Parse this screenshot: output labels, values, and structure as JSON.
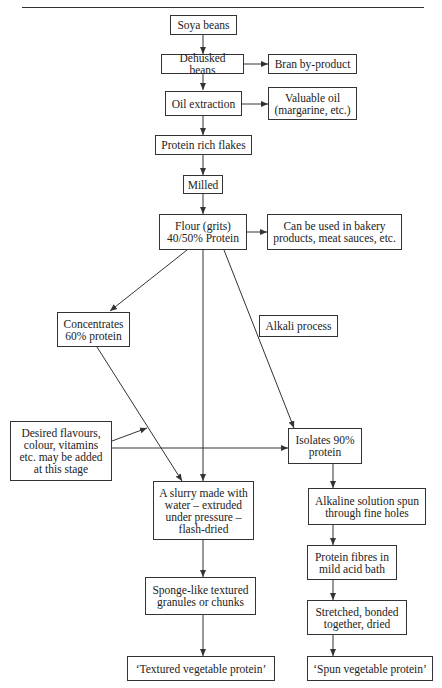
{
  "nodes": {
    "soya": "Soya beans",
    "dehusked": "Dehusked beans",
    "bran": "Bran by-product",
    "oil": "Oil extraction",
    "valuable_oil": "Valuable oil\n(margarine, etc.)",
    "flakes": "Protein rich flakes",
    "milled": "Milled",
    "flour": "Flour (grits)\n40/50% Protein",
    "bakery": "Can be used in bakery\nproducts, meat sauces, etc.",
    "concentrates": "Concentrates\n60% protein",
    "alkali": "Alkali process",
    "flavours": "Desired flavours,\ncolour, vitamins\netc. may be added\nat this stage",
    "isolates": "Isolates 90%\nprotein",
    "slurry": "A slurry made with\nwater – extruded\nunder pressure –\nflash-dried",
    "alkaline": "Alkaline solution spun\nthrough fine holes",
    "fibres": "Protein fibres in\nmild acid bath",
    "sponge": "Sponge-like textured\ngranules or chunks",
    "stretched": "Stretched, bonded\ntogether, dried",
    "tvp": "‘Textured vegetable protein’",
    "svp": "‘Spun vegetable protein’"
  },
  "edges": [
    {
      "from": "soya",
      "to": "dehusked"
    },
    {
      "from": "dehusked",
      "to": "bran"
    },
    {
      "from": "dehusked",
      "to": "oil"
    },
    {
      "from": "oil",
      "to": "valuable_oil"
    },
    {
      "from": "oil",
      "to": "flakes"
    },
    {
      "from": "flakes",
      "to": "milled"
    },
    {
      "from": "milled",
      "to": "flour"
    },
    {
      "from": "flour",
      "to": "bakery"
    },
    {
      "from": "flour",
      "to": "concentrates"
    },
    {
      "from": "flour",
      "to": "slurry"
    },
    {
      "from": "flour",
      "to": "isolates",
      "label": "alkali"
    },
    {
      "from": "concentrates",
      "to": "slurry"
    },
    {
      "from": "flavours",
      "to": "concentrates-slurry-line"
    },
    {
      "from": "flavours",
      "to": "isolates"
    },
    {
      "from": "isolates",
      "to": "alkaline"
    },
    {
      "from": "alkaline",
      "to": "fibres"
    },
    {
      "from": "fibres",
      "to": "stretched"
    },
    {
      "from": "stretched",
      "to": "svp"
    },
    {
      "from": "slurry",
      "to": "sponge"
    },
    {
      "from": "sponge",
      "to": "tvp"
    }
  ]
}
